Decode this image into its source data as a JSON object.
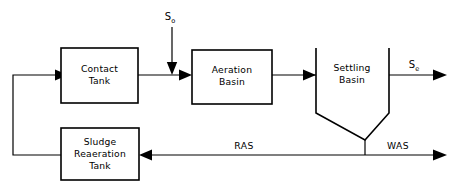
{
  "diagram": {
    "type": "process-flow-diagram",
    "background_color": "#ffffff",
    "line_color": "#000000"
  },
  "units": [
    {
      "id": "contact-tank",
      "label_line1": "Contact",
      "label_line2": "Tank",
      "shape": "rectangle"
    },
    {
      "id": "aeration-basin",
      "label_line1": "Aeration",
      "label_line2": "Basin",
      "shape": "rectangle"
    },
    {
      "id": "settling-basin",
      "label_line1": "Settling",
      "label_line2": "Basin",
      "shape": "hopper-clarifier"
    },
    {
      "id": "sludge-reaeration-tank",
      "label_line1": "Sludge",
      "label_line2": "Reaeration",
      "label_line3": "Tank",
      "shape": "rectangle"
    }
  ],
  "streams": {
    "influent": {
      "symbol": "S",
      "subscript": "o",
      "direction": "down"
    },
    "effluent": {
      "symbol": "S",
      "subscript": "e",
      "direction": "right"
    },
    "return_activated_sludge": {
      "label": "RAS",
      "direction": "left"
    },
    "waste_activated_sludge": {
      "label": "WAS",
      "direction": "right"
    }
  }
}
